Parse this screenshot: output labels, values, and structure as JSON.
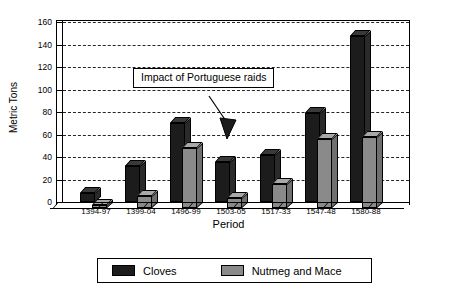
{
  "chart_data": {
    "type": "bar",
    "title": "",
    "xlabel": "Period",
    "ylabel": "Metric Tons",
    "ylim": [
      0,
      160
    ],
    "ytick_step": 20,
    "yticks": [
      0,
      20,
      40,
      60,
      80,
      100,
      120,
      140,
      160
    ],
    "grid": true,
    "legend_position": "bottom",
    "categories": [
      "1394-97",
      "1399-04",
      "1496-99",
      "1503-05",
      "1517-33",
      "1547-48",
      "1580-88"
    ],
    "series": [
      {
        "name": "Cloves",
        "color": "#1c1c1c",
        "values": [
          8,
          32,
          70,
          36,
          42,
          79,
          148
        ]
      },
      {
        "name": "Nutmeg and Mace",
        "color": "#8a8a8a",
        "values": [
          3,
          11,
          53,
          9,
          21,
          61,
          63
        ]
      }
    ],
    "annotations": [
      {
        "text": "Impact of Portuguese raids",
        "points_to_category": "1503-05"
      }
    ]
  },
  "axes": {
    "y_title": "Metric Tons",
    "x_title": "Period"
  },
  "legend": {
    "items": [
      {
        "label": "Cloves",
        "swatch": "dark-swatch"
      },
      {
        "label": "Nutmeg and Mace",
        "swatch": "gray-swatch"
      }
    ]
  },
  "annotation": {
    "label": "Impact of Portuguese raids"
  },
  "colors": {
    "cloves": "#1c1c1c",
    "nutmeg": "#8a8a8a",
    "axis": "#000000",
    "background": "#ffffff"
  }
}
